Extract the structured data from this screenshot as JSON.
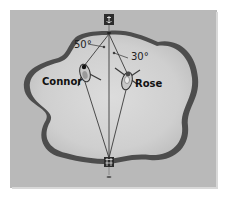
{
  "diagram": {
    "background_color": "#b9b9b9",
    "lake_fill": "#d2d2d2",
    "shore_color": "#4a4a4a",
    "markers": {
      "top": {
        "icon": "anchor-icon",
        "x": 109,
        "y": 20
      },
      "bottom": {
        "icon": "dock-icon",
        "x": 109,
        "y": 163
      }
    },
    "boats": [
      {
        "name": "Connor",
        "label": "Connor",
        "x": 84,
        "y": 73,
        "angle_label": "50°"
      },
      {
        "name": "Rose",
        "label": "Rose",
        "x": 127,
        "y": 80,
        "angle_label": "30°"
      }
    ],
    "angles": [
      {
        "text": "50°",
        "x": 74,
        "y": 48
      },
      {
        "text": "30°",
        "x": 131,
        "y": 60
      }
    ],
    "labels": [
      {
        "text": "Connor",
        "x": 42,
        "y": 85
      },
      {
        "text": "Rose",
        "x": 135,
        "y": 87
      }
    ]
  }
}
